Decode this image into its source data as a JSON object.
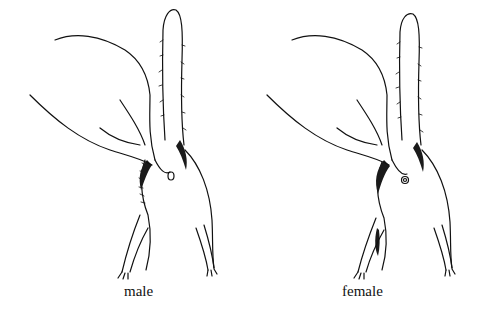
{
  "figure": {
    "panels": [
      {
        "id": "male",
        "caption": "male"
      },
      {
        "id": "female",
        "caption": "female"
      }
    ]
  }
}
